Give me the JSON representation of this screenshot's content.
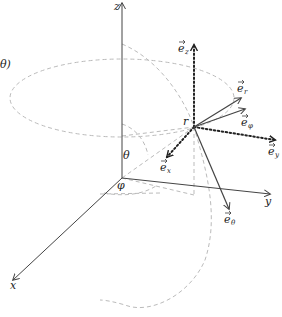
{
  "diagram": {
    "colors": {
      "axis": "#444444",
      "vector": "#444444",
      "dotted": "#222222",
      "dashed": "#bbbbbb",
      "text": "#222222"
    },
    "axes": {
      "z": "z",
      "y": "y",
      "x": "x"
    },
    "angles": {
      "theta": "θ",
      "phi": "φ",
      "theta_partial": "θ)"
    },
    "point_label": "r",
    "vectors": {
      "e_z": {
        "base": "e",
        "sub": "z",
        "style": "dotted"
      },
      "e_y": {
        "base": "e",
        "sub": "y",
        "style": "dotted"
      },
      "e_x": {
        "base": "e",
        "sub": "x",
        "style": "dotted"
      },
      "e_r": {
        "base": "e",
        "sub": "r",
        "style": "solid"
      },
      "e_phi": {
        "base": "e",
        "sub": "φ",
        "style": "solid"
      },
      "e_theta": {
        "base": "e",
        "sub": "θ",
        "style": "solid"
      }
    }
  }
}
